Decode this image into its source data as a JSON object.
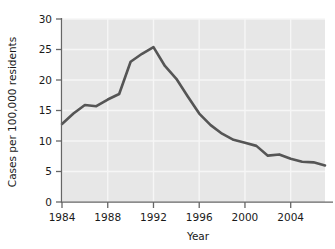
{
  "chart_data": {
    "type": "line",
    "title": "",
    "subtitle": "",
    "xlabel": "Year",
    "ylabel": "Cases per 100,000 residents",
    "xlim": [
      1984,
      2007
    ],
    "ylim": [
      0,
      30
    ],
    "grid": true,
    "legend": null,
    "xticks": [
      1984,
      1988,
      1992,
      1996,
      2000,
      2004
    ],
    "xtick_labels": [
      "1984",
      "1988",
      "1992",
      "1996",
      "2000",
      "2004"
    ],
    "yticks": [
      0,
      5,
      10,
      15,
      20,
      25,
      30
    ],
    "ytick_labels": [
      "0",
      "5",
      "10",
      "15",
      "20",
      "25",
      "30"
    ],
    "series": [
      {
        "name": "Cases per 100,000 residents",
        "color": "#555555",
        "x": [
          1984,
          1985,
          1986,
          1987,
          1988,
          1989,
          1990,
          1991,
          1992,
          1993,
          1994,
          1995,
          1996,
          1997,
          1998,
          1999,
          2000,
          2001,
          2002,
          2003,
          2004,
          2005,
          2006,
          2007
        ],
        "values": [
          12.8,
          14.5,
          15.9,
          15.7,
          16.8,
          17.7,
          23.0,
          24.3,
          25.4,
          22.3,
          20.2,
          17.3,
          14.5,
          12.6,
          11.2,
          10.2,
          9.7,
          9.2,
          7.6,
          7.8,
          7.1,
          6.6,
          6.5,
          6.0
        ]
      }
    ]
  },
  "axes": {
    "ylabel": "Cases per 100,000 residents",
    "xlabel": "Year"
  },
  "colors": {
    "plot_background": "#e7e7e7",
    "gridline": "#f6f6f6",
    "line": "#555555",
    "axis": "#666666",
    "text": "#1a1a1a",
    "page_background": "#ffffff"
  }
}
